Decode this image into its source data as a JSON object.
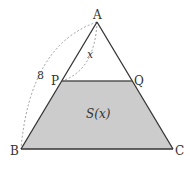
{
  "diagram": {
    "type": "geometry-triangle",
    "colors": {
      "stroke": "#333333",
      "fill_shaded": "#cccccc",
      "dashed": "#888888",
      "background": "#ffffff"
    },
    "points": {
      "A": {
        "label": "A",
        "x": 97,
        "y": 22
      },
      "B": {
        "label": "B",
        "x": 21,
        "y": 149
      },
      "C": {
        "label": "C",
        "x": 173,
        "y": 149
      },
      "P": {
        "label": "P",
        "x": 62,
        "y": 81
      },
      "Q": {
        "label": "Q",
        "x": 132,
        "y": 81
      }
    },
    "annotations": {
      "AB_length": "8",
      "AP_length": "x",
      "shaded_area": "S(x)"
    }
  }
}
